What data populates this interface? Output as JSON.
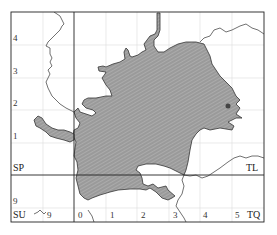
{
  "map": {
    "grid_squares": {
      "top_left": "SP",
      "top_right": "TL",
      "bottom_left": "SU",
      "bottom_right": "TQ"
    },
    "northing_labels": [
      "4",
      "3",
      "2",
      "1",
      "9"
    ],
    "easting_labels": [
      "9",
      "0",
      "1",
      "2",
      "3",
      "4",
      "5"
    ],
    "colors": {
      "region_fill": "#9a9a9a",
      "hatch": "#b8b8b8",
      "outline": "#333333",
      "grid": "#d8d8d8",
      "frame": "#222222"
    }
  }
}
